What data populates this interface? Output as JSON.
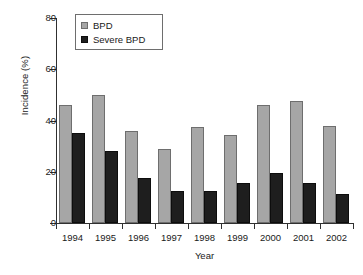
{
  "chart_data": {
    "type": "bar",
    "title": "",
    "xlabel": "Year",
    "ylabel": "Incidence (%)",
    "categories": [
      "1994",
      "1995",
      "1996",
      "1997",
      "1998",
      "1999",
      "2000",
      "2001",
      "2002"
    ],
    "series": [
      {
        "name": "BPD",
        "color": "#a6a6a6",
        "values": [
          46,
          50,
          36,
          29,
          37.5,
          34.5,
          46,
          47.5,
          38
        ]
      },
      {
        "name": "Severe BPD",
        "color": "#1e1e1e",
        "values": [
          35,
          28,
          17.5,
          12.5,
          12.5,
          15.5,
          19.5,
          15.5,
          11.5
        ]
      }
    ],
    "ylim": [
      0,
      80
    ],
    "yticks": [
      0,
      20,
      40,
      60,
      80
    ],
    "ytick_labels": [
      "0",
      "20",
      "40",
      "60",
      "80"
    ],
    "grid": false,
    "legend_position": "top-left"
  },
  "legend": {
    "items": [
      {
        "label": "BPD",
        "swatch": "gray-square-swatch"
      },
      {
        "label": "Severe BPD",
        "swatch": "black-square-swatch"
      }
    ]
  },
  "axes": {
    "y_title": "Incidence (%)",
    "x_title": "Year"
  }
}
